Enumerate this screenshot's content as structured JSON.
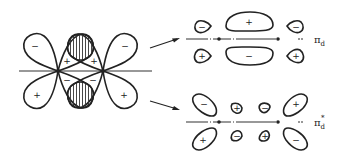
{
  "left_diagram": {
    "description": "Two d-orbitals overlapping forming delta-type lobes with hatched overlap region",
    "signs": {
      "left_top": "−",
      "left_bottom": "+",
      "right_top": "−",
      "right_bottom": "+",
      "center_upper_left": "+",
      "center_upper_right": "+",
      "center_lower_left": "−",
      "center_lower_right": "−"
    }
  },
  "pi_bonding": {
    "label": "π",
    "subscript": "d",
    "superscript": "",
    "signs": {
      "center_top": "+",
      "center_bottom": "−",
      "left_top": "−",
      "left_bottom": "+",
      "right_top": "−",
      "right_bottom": "+"
    }
  },
  "pi_antibonding": {
    "label": "π",
    "subscript": "d",
    "superscript": "*",
    "signs": {
      "outer_left_top": "−",
      "outer_left_bottom": "+",
      "outer_right_top": "+",
      "outer_right_bottom": "−",
      "inner_left_top": "+",
      "inner_left_bottom": "−",
      "inner_right_top": "−",
      "inner_right_bottom": "+"
    }
  },
  "colors": {
    "stroke": "#222222",
    "background": "#ffffff"
  }
}
